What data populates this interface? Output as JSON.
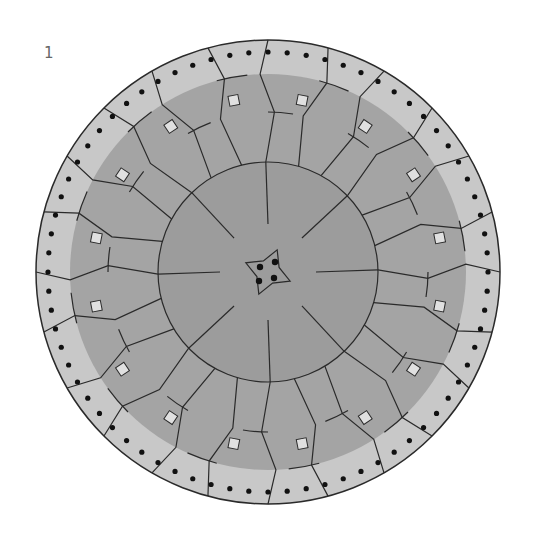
{
  "figure": {
    "label": "1",
    "center": [
      268,
      272
    ],
    "radius_outer": 232,
    "radius_dot_ring": 220,
    "radius_light_ring_inner": 198,
    "radius_mid_ring": 160,
    "radius_inner_ring": 110,
    "radius_hub": 40,
    "segments": 24,
    "dots": 72,
    "squares": 16,
    "colors": {
      "outer_ring": "#c8c8c8",
      "mid_fill": "#a4a4a4",
      "inner_fill": "#9c9c9c",
      "stroke": "#2a2a2a",
      "dot": "#111111",
      "square": "#e0e0e0"
    }
  }
}
